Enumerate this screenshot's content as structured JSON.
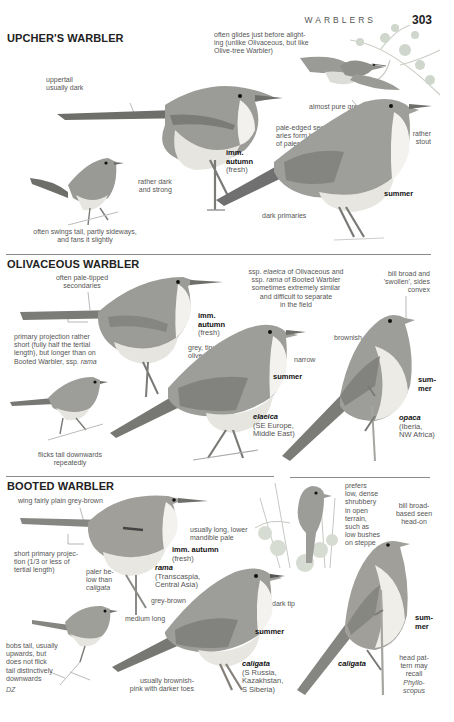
{
  "header": {
    "running_title": "WARBLERS",
    "page_number": "303"
  },
  "sections": [
    {
      "title": "UPCHER'S WARBLER",
      "notes": {
        "flight": "often glides just before alighting (unlike Olivaceous, but like Olive-tree Warbler)",
        "flight_l1": "often glides just before alight-",
        "flight_l2": "ing (unlike Olivaceous, but like",
        "flight_l3": "Olive-tree Warbler)",
        "uppertail_l1": "uppertail",
        "uppertail_l2": "usually dark",
        "legs_l1": "rather dark",
        "legs_l2": "and strong",
        "tail_l1": "often swings tail, partly sideways,",
        "tail_l2": "and fans it slightly",
        "grey": "almost pure grey",
        "secondaries_l1": "pale-edged second-",
        "secondaries_l2": "aries form hint",
        "secondaries_l3": "of paler panel",
        "bill_l1": "rather",
        "bill_l2": "stout",
        "primaries": "dark primaries"
      },
      "labels": {
        "imm_l1": "imm.",
        "imm_l2": "autumn",
        "imm_l3": "(fresh)",
        "summer": "summer"
      }
    },
    {
      "title": "OLIVACEOUS WARBLER",
      "notes": {
        "secondaries_l1": "often pale-tipped",
        "secondaries_l2": "secondaries",
        "projection_l1": "primary projection rather",
        "projection_l2": "short (fully half the tertial",
        "projection_l3": "length), but longer than on",
        "projection_l4a": "Booted Warbler, ssp. ",
        "projection_l4b": "rama",
        "similar_l1a": "ssp. ",
        "similar_l1b": "elaeica",
        "similar_l1c": " of Olivaceous and",
        "similar_l2a": "ssp. ",
        "similar_l2b": "rama",
        "similar_l2c": " of Booted Warbler",
        "similar_l3": "sometimes extremely similar",
        "similar_l4": "and difficult to separate",
        "similar_l5": "in the field",
        "bill_l1": "bill broad and",
        "bill_l2": "'swollen', sides",
        "bill_l3": "convex",
        "grey_olive_l1": "grey, tinged",
        "grey_olive_l2": "olive",
        "narrow": "narrow",
        "brownish": "brownish-grey",
        "tail_l1": "flicks tail downwards",
        "tail_l2": "repeatedly"
      },
      "labels": {
        "imm_l1": "imm.",
        "imm_l2": "autumn",
        "imm_l3": "(fresh)",
        "summer": "summer",
        "summer2_l1": "sum-",
        "summer2_l2": "mer",
        "elaeica": "elaeica",
        "elaeica_range_l1": "(SE Europe,",
        "elaeica_range_l2": "Middle East)",
        "opaca": "opaca",
        "opaca_range_l1": "(Iberia,",
        "opaca_range_l2": "NW Africa)"
      }
    },
    {
      "title": "BOOTED WARBLER",
      "notes": {
        "wing": "wing fairly plain grey-brown",
        "mandible_l1": "usually long, lower",
        "mandible_l2": "mandible pale",
        "habitat_l1": "prefers",
        "habitat_l2": "low, dense",
        "habitat_l3": "shrubbery",
        "habitat_l4": "in open",
        "habitat_l5": "terrain,",
        "habitat_l6": "such as",
        "habitat_l7": "low bushes",
        "habitat_l8": "on steppe",
        "bill_l1": "bill broad-",
        "bill_l2": "based seen",
        "bill_l3": "head-on",
        "projection_l1": "short primary projec-",
        "projection_l2": "tion (1/3 or less of",
        "projection_l3": "tertial length)",
        "paler_l1": "paler be-",
        "paler_l2": "low than",
        "paler_l3": "caligata",
        "greybrown": "grey-brown",
        "medium": "medium long",
        "darktip": "dark tip",
        "tail_l1": "bobs tail, usually",
        "tail_l2": "upwards, but",
        "tail_l3": "does not flick",
        "tail_l4": "tail distinctively",
        "tail_l5": "downwards",
        "legs_l1": "usually brownish-",
        "legs_l2": "pink with darker toes",
        "head_l1": "head pat-",
        "head_l2": "tern may",
        "head_l3": "recall",
        "head_l4": "Phyllo-",
        "head_l5": "scopus"
      },
      "labels": {
        "imm": "imm. autumn",
        "imm_fresh": "(fresh)",
        "rama": "rama",
        "rama_range_l1": "(Transcaspia,",
        "rama_range_l2": "Central Asia)",
        "summer": "summer",
        "summer2_l1": "sum-",
        "summer2_l2": "mer",
        "caligata": "caligata",
        "caligata_range_l1": "(S Russia,",
        "caligata_range_l2": "Kazakhstan,",
        "caligata_range_l3": "S Siberia)",
        "caligata2": "caligata"
      }
    }
  ],
  "credit": "DZ",
  "colors": {
    "bird_upper": "#8d8d88",
    "bird_under": "#e4e3de",
    "text": "#555555",
    "rule": "#8a8a8a"
  }
}
